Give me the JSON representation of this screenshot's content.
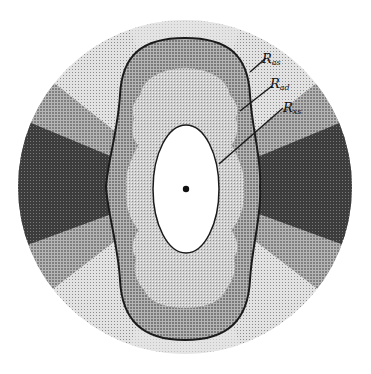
{
  "diagram": {
    "labels": [
      {
        "main": "R",
        "sub": "as",
        "x": 270,
        "y": 63
      },
      {
        "main": "R",
        "sub": "ad",
        "x": 274,
        "y": 88
      },
      {
        "main": "R",
        "sub": "xs",
        "x": 283,
        "y": 113
      }
    ],
    "colors": {
      "background": "#ffffff",
      "outer_light": "#d8d8d8",
      "sector_mid": "#9a9a9a",
      "sector_dark": "#4a4a4a",
      "peanut_fill": "#8f8f8f",
      "inner_zone": "#c4c4c4",
      "ellipse_fill": "#ffffff",
      "outline": "#1a1a1a"
    }
  }
}
